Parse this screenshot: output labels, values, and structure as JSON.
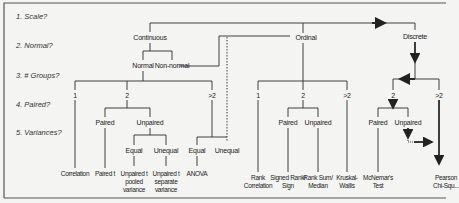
{
  "questions": [
    {
      "label": "1. Scale?"
    },
    {
      "label": "2. Normal?"
    },
    {
      "label": "3. # Groups?"
    },
    {
      "label": "4. Paired?"
    },
    {
      "label": "5. Variances?"
    }
  ],
  "nodes": {
    "continuous": "Continuous",
    "ordinal": "Ordinal",
    "discrete": "Discrete",
    "normal": "Normal",
    "non_normal": "Non-normal",
    "cont_g1": "1",
    "cont_g2": "2",
    "cont_g3": ">2",
    "cont_paired": "Paired",
    "cont_unpaired": "Unpaired",
    "cont_equal": "Equal",
    "cont_unequal": "Unequal",
    "anova_equal": "Equal",
    "anova_unequal": "Unequal",
    "ord_g1": "1",
    "ord_g2": "2",
    "ord_g3": ">2",
    "ord_paired": "Paired",
    "ord_unpaired": "Unpaired",
    "disc_g2": "2",
    "disc_g3": ">2",
    "disc_paired": "Paired",
    "disc_unpaired": "Unpaired"
  },
  "leaves": {
    "correlation": "Correlation",
    "paired_t": "Paired t",
    "unpaired_pooled_1": "Unpaired t",
    "unpaired_pooled_2": "pooled",
    "unpaired_pooled_3": "variance",
    "unpaired_separate_1": "Unpaired t",
    "unpaired_separate_2": "separate",
    "unpaired_separate_3": "variance",
    "anova": "ANOVA",
    "rank_corr_1": "Rank",
    "rank_corr_2": "Correlation",
    "signed_rank_1": "Signed Rank/",
    "signed_rank_2": "Sign",
    "rank_sum_1": "Rank Sum/",
    "rank_sum_2": "Median",
    "kruskal_1": "Kruskal-",
    "kruskal_2": "Wallis",
    "mcnemar_1": "McNemar's",
    "mcnemar_2": "Test",
    "pearson_1": "Pearson",
    "pearson_2": "Chi-Squ..."
  },
  "colors": {
    "line": "#2a2a2a",
    "background": "#f4f4f2",
    "frame": "#555555"
  }
}
